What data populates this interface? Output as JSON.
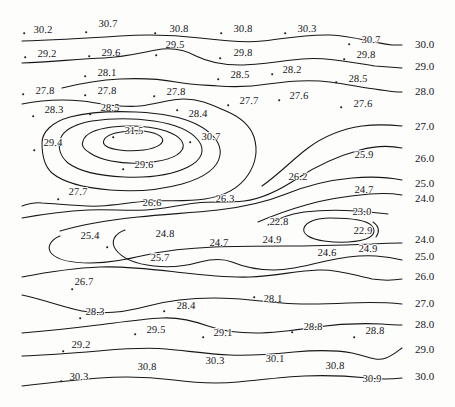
{
  "figure": {
    "type": "contour-map",
    "title": "",
    "background": "#fdfdfc",
    "line_color": "#17171a",
    "width": 455,
    "height": 407
  },
  "chart_data": {
    "type": "heatmap",
    "title": "",
    "xlabel": "",
    "ylabel": "",
    "subtitle": "",
    "contour_interval": 1.0,
    "contour_levels": [
      24.0,
      25.0,
      26.0,
      27.0,
      28.0,
      29.0,
      30.0,
      31.0
    ],
    "value_range": [
      22.8,
      31.5
    ],
    "grid": false,
    "legend": "none",
    "axis_ticks": [],
    "edge_labels": {
      "right_upper": [
        "30.0",
        "29.0",
        "28.0",
        "27.0",
        "26.0",
        "25.0",
        "24.0"
      ],
      "right_lower": [
        "24.0",
        "25.0",
        "26.0",
        "27.0",
        "28.0",
        "29.0",
        "30.0"
      ]
    },
    "data_points": [
      {
        "label": "30.2",
        "x": 43,
        "y": 30,
        "dot_x": 24,
        "dot_y": 33,
        "value": 30.2
      },
      {
        "label": "30.7",
        "x": 108,
        "y": 24,
        "dot_x": 86,
        "dot_y": 32,
        "value": 30.7
      },
      {
        "label": "30.8",
        "x": 179,
        "y": 29,
        "dot_x": 155,
        "dot_y": 33,
        "value": 30.8
      },
      {
        "label": "30.8",
        "x": 243,
        "y": 29,
        "dot_x": 221,
        "dot_y": 33,
        "value": 30.8
      },
      {
        "label": "30.3",
        "x": 307,
        "y": 29,
        "dot_x": 285,
        "dot_y": 33,
        "value": 30.3
      },
      {
        "label": "30.7",
        "x": 371,
        "y": 40,
        "dot_x": 349,
        "dot_y": 44,
        "value": 30.7
      },
      {
        "label": "29.2",
        "x": 47,
        "y": 54,
        "dot_x": 25,
        "dot_y": 57,
        "value": 29.2
      },
      {
        "label": "29.6",
        "x": 111,
        "y": 53,
        "dot_x": 89,
        "dot_y": 56,
        "value": 29.6
      },
      {
        "label": "29.5",
        "x": 175,
        "y": 45,
        "dot_x": 156,
        "dot_y": 55,
        "value": 29.5
      },
      {
        "label": "29.8",
        "x": 243,
        "y": 53,
        "dot_x": 220,
        "dot_y": 58,
        "value": 29.8
      },
      {
        "label": "29.8",
        "x": 366,
        "y": 55,
        "dot_x": 344,
        "dot_y": 59,
        "value": 29.8
      },
      {
        "label": "28.1",
        "x": 107,
        "y": 73,
        "dot_x": 85,
        "dot_y": 76,
        "value": 28.1
      },
      {
        "label": "28.5",
        "x": 240,
        "y": 75,
        "dot_x": 218,
        "dot_y": 79,
        "value": 28.5
      },
      {
        "label": "28.2",
        "x": 292,
        "y": 70,
        "dot_x": 272,
        "dot_y": 74,
        "value": 28.2
      },
      {
        "label": "28.5",
        "x": 358,
        "y": 79,
        "dot_x": 336,
        "dot_y": 82,
        "value": 28.5
      },
      {
        "label": "27.8",
        "x": 45,
        "y": 91,
        "dot_x": 23,
        "dot_y": 94,
        "value": 27.8
      },
      {
        "label": "27.8",
        "x": 107,
        "y": 91,
        "dot_x": 85,
        "dot_y": 95,
        "value": 27.8
      },
      {
        "label": "27.8",
        "x": 176,
        "y": 92,
        "dot_x": 154,
        "dot_y": 96,
        "value": 27.8
      },
      {
        "label": "27.7",
        "x": 249,
        "y": 101,
        "dot_x": 228,
        "dot_y": 105,
        "value": 27.7
      },
      {
        "label": "27.6",
        "x": 299,
        "y": 96,
        "dot_x": 279,
        "dot_y": 100,
        "value": 27.6
      },
      {
        "label": "27.6",
        "x": 363,
        "y": 104,
        "dot_x": 341,
        "dot_y": 107,
        "value": 27.6
      },
      {
        "label": "28.3",
        "x": 54,
        "y": 110,
        "dot_x": 33,
        "dot_y": 116,
        "value": 28.3
      },
      {
        "label": "28.5",
        "x": 110,
        "y": 108,
        "dot_x": 90,
        "dot_y": 114,
        "value": 28.5
      },
      {
        "label": "28.4",
        "x": 198,
        "y": 114,
        "dot_x": 177,
        "dot_y": 110,
        "value": 28.4
      },
      {
        "label": "31.5",
        "x": 134,
        "y": 131,
        "dot_x": 113,
        "dot_y": 137,
        "value": 31.5
      },
      {
        "label": "30.7",
        "x": 211,
        "y": 137,
        "dot_x": 190,
        "dot_y": 142,
        "value": 30.7
      },
      {
        "label": "29.4",
        "x": 53,
        "y": 143,
        "dot_x": 34,
        "dot_y": 150,
        "value": 29.4
      },
      {
        "label": "29.6",
        "x": 144,
        "y": 165,
        "dot_x": 123,
        "dot_y": 169,
        "value": 29.6
      },
      {
        "label": "25.9",
        "x": 364,
        "y": 155,
        "dot_x": 0,
        "dot_y": 0,
        "value": 25.9
      },
      {
        "label": "26.2",
        "x": 298,
        "y": 177,
        "dot_x": 0,
        "dot_y": 0,
        "value": 26.2
      },
      {
        "label": "24.7",
        "x": 364,
        "y": 190,
        "dot_x": 0,
        "dot_y": 0,
        "value": 24.7
      },
      {
        "label": "27.7",
        "x": 78,
        "y": 192,
        "dot_x": 58,
        "dot_y": 199,
        "value": 27.7
      },
      {
        "label": "26.6",
        "x": 152,
        "y": 203,
        "dot_x": 0,
        "dot_y": 0,
        "value": 26.6
      },
      {
        "label": "26.3",
        "x": 225,
        "y": 199,
        "dot_x": 0,
        "dot_y": 0,
        "value": 26.3
      },
      {
        "label": "23.0",
        "x": 362,
        "y": 212,
        "dot_x": 0,
        "dot_y": 0,
        "value": 23.0
      },
      {
        "label": "22.8",
        "x": 279,
        "y": 222,
        "dot_x": 0,
        "dot_y": 0,
        "value": 22.8
      },
      {
        "label": "22.9",
        "x": 363,
        "y": 231,
        "dot_x": 0,
        "dot_y": 0,
        "value": 22.9
      },
      {
        "label": "25.4",
        "x": 90,
        "y": 236,
        "dot_x": 107,
        "dot_y": 247,
        "value": 25.4
      },
      {
        "label": "24.8",
        "x": 165,
        "y": 234,
        "dot_x": 0,
        "dot_y": 0,
        "value": 24.8
      },
      {
        "label": "24.7",
        "x": 219,
        "y": 243,
        "dot_x": 0,
        "dot_y": 0,
        "value": 24.7
      },
      {
        "label": "24.9",
        "x": 272,
        "y": 240,
        "dot_x": 0,
        "dot_y": 0,
        "value": 24.9
      },
      {
        "label": "24.6",
        "x": 327,
        "y": 253,
        "dot_x": 0,
        "dot_y": 0,
        "value": 24.6
      },
      {
        "label": "24.9",
        "x": 368,
        "y": 249,
        "dot_x": 0,
        "dot_y": 0,
        "value": 24.9
      },
      {
        "label": "25.7",
        "x": 160,
        "y": 258,
        "dot_x": 0,
        "dot_y": 0,
        "value": 25.7
      },
      {
        "label": "26.7",
        "x": 84,
        "y": 282,
        "dot_x": 72,
        "dot_y": 289,
        "value": 26.7
      },
      {
        "label": "28.3",
        "x": 95,
        "y": 312,
        "dot_x": 80,
        "dot_y": 318,
        "value": 28.3
      },
      {
        "label": "28.4",
        "x": 186,
        "y": 306,
        "dot_x": 164,
        "dot_y": 311,
        "value": 28.4
      },
      {
        "label": "28.1",
        "x": 273,
        "y": 299,
        "dot_x": 254,
        "dot_y": 297,
        "value": 28.1
      },
      {
        "label": "29.5",
        "x": 156,
        "y": 330,
        "dot_x": 135,
        "dot_y": 334,
        "value": 29.5
      },
      {
        "label": "29.1",
        "x": 223,
        "y": 333,
        "dot_x": 203,
        "dot_y": 337,
        "value": 29.1
      },
      {
        "label": "28.8",
        "x": 313,
        "y": 327,
        "dot_x": 292,
        "dot_y": 332,
        "value": 28.8
      },
      {
        "label": "28.8",
        "x": 375,
        "y": 331,
        "dot_x": 354,
        "dot_y": 337,
        "value": 28.8
      },
      {
        "label": "29.2",
        "x": 81,
        "y": 345,
        "dot_x": 63,
        "dot_y": 351,
        "value": 29.2
      },
      {
        "label": "30.3",
        "x": 215,
        "y": 361,
        "dot_x": 0,
        "dot_y": 0,
        "value": 30.3
      },
      {
        "label": "30.1",
        "x": 275,
        "y": 359,
        "dot_x": 0,
        "dot_y": 0,
        "value": 30.1
      },
      {
        "label": "30.8",
        "x": 147,
        "y": 367,
        "dot_x": 0,
        "dot_y": 0,
        "value": 30.8
      },
      {
        "label": "30.8",
        "x": 335,
        "y": 366,
        "dot_x": 0,
        "dot_y": 0,
        "value": 30.8
      },
      {
        "label": "30.3",
        "x": 79,
        "y": 377,
        "dot_x": 61,
        "dot_y": 381,
        "value": 30.3
      },
      {
        "label": "30.9",
        "x": 372,
        "y": 379,
        "dot_x": 0,
        "dot_y": 0,
        "value": 30.9
      }
    ],
    "level_labels": [
      {
        "label": "30.0",
        "x": 415,
        "y": 44
      },
      {
        "label": "29.0",
        "x": 415,
        "y": 66
      },
      {
        "label": "28.0",
        "x": 415,
        "y": 91
      },
      {
        "label": "27.0",
        "x": 415,
        "y": 126
      },
      {
        "label": "26.0",
        "x": 415,
        "y": 158
      },
      {
        "label": "25.0",
        "x": 415,
        "y": 183
      },
      {
        "label": "24.0",
        "x": 415,
        "y": 198
      },
      {
        "label": "24.0",
        "x": 415,
        "y": 239
      },
      {
        "label": "25.0",
        "x": 415,
        "y": 256
      },
      {
        "label": "26.0",
        "x": 415,
        "y": 276
      },
      {
        "label": "27.0",
        "x": 415,
        "y": 303
      },
      {
        "label": "28.0",
        "x": 415,
        "y": 324
      },
      {
        "label": "29.0",
        "x": 415,
        "y": 349
      },
      {
        "label": "30.0",
        "x": 415,
        "y": 376
      }
    ]
  }
}
